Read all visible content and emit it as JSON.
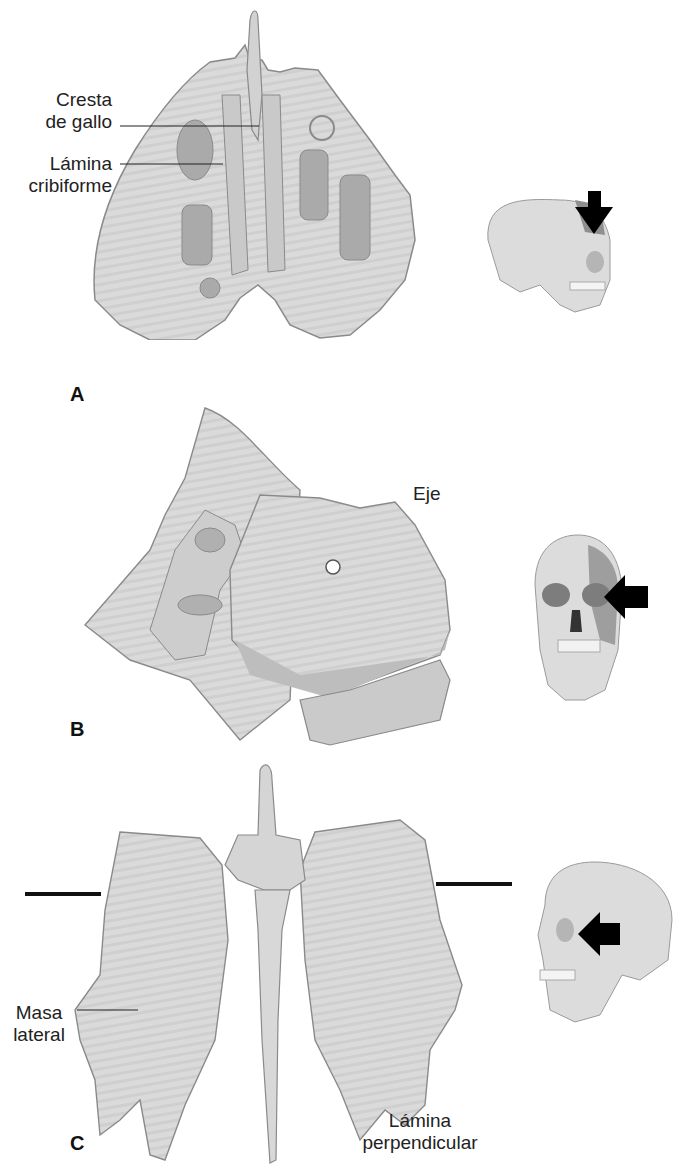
{
  "figure": {
    "colors": {
      "bone_fill": "#d9d9d9",
      "bone_shade": "#b8b8b8",
      "bone_outline": "#8a8a8a",
      "cavity": "#a9a9a9",
      "arrow": "#000000",
      "highlight_region": "#8f8f8f"
    },
    "panels": [
      {
        "letter": "A",
        "view": "superior",
        "labels": [
          {
            "line1": "Cresta",
            "line2": "de gallo"
          },
          {
            "line1": "Lámina",
            "line2": "cribiforme"
          }
        ],
        "locator": {
          "icon": "skull-lateral-icon",
          "arrow": "down-arrow-icon"
        }
      },
      {
        "letter": "B",
        "view": "lateral",
        "labels": [
          {
            "line1": "Eje"
          }
        ],
        "locator": {
          "icon": "skull-frontal-icon",
          "arrow": "left-arrow-icon"
        }
      },
      {
        "letter": "C",
        "view": "posterior",
        "labels": [
          {
            "line1": "Masa",
            "line2": "lateral"
          },
          {
            "line1": "Lámina",
            "line2": "perpendicular"
          }
        ],
        "locator": {
          "icon": "skull-lateral-icon",
          "arrow": "left-arrow-icon"
        }
      }
    ]
  }
}
